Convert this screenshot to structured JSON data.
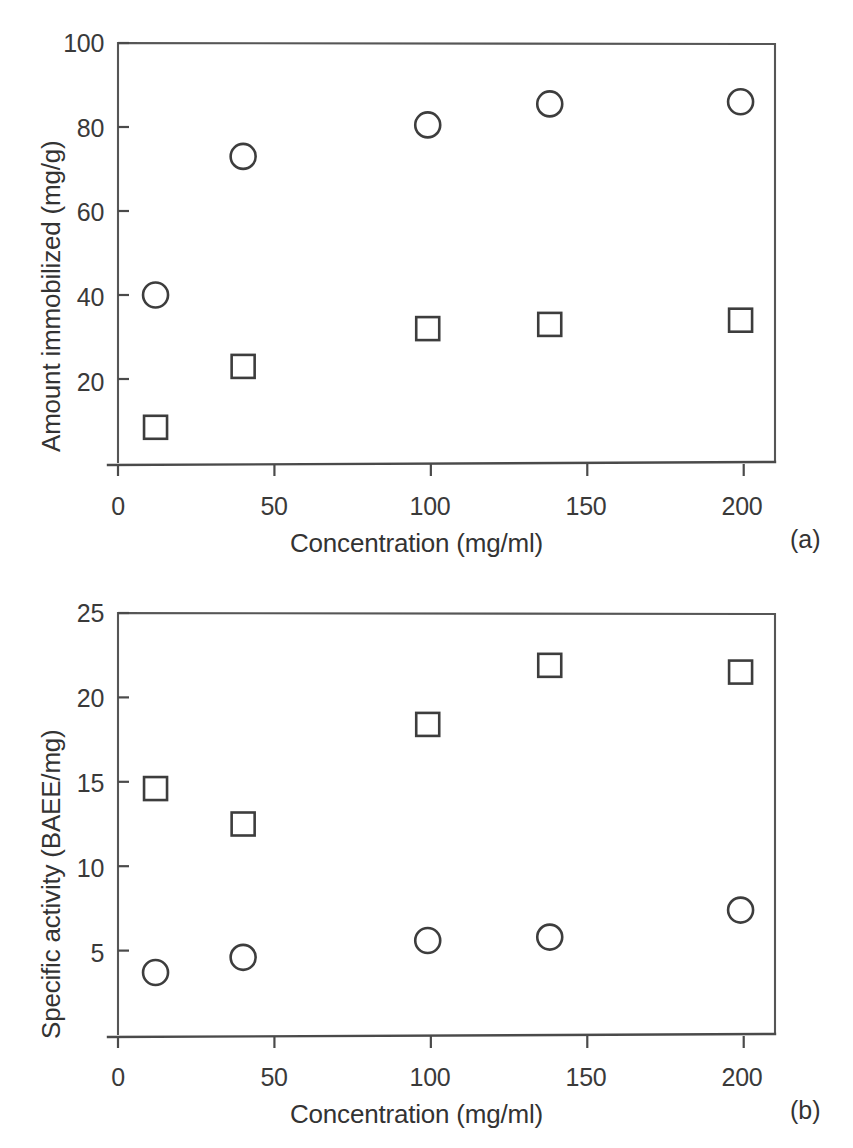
{
  "figure": {
    "background": "#ffffff",
    "ink_color": "#3d3d3d"
  },
  "panels": [
    {
      "id": "a",
      "letter": "(a)",
      "x_title": "Concentration (mg/ml)",
      "y_title": "Amount immobilized (mg/g)",
      "x_ticks": [
        "0",
        "50",
        "100",
        "150",
        "200"
      ],
      "y_ticks": [
        "100",
        "80",
        "60",
        "40",
        "20"
      ]
    },
    {
      "id": "b",
      "letter": "(b)",
      "x_title": "Concentration (mg/ml)",
      "y_title": "Specific activity (BAEE/mg)",
      "x_ticks": [
        "0",
        "50",
        "100",
        "150",
        "200"
      ],
      "y_ticks": [
        "25",
        "20",
        "15",
        "10",
        "5"
      ]
    }
  ],
  "chart_data": [
    {
      "type": "scatter",
      "panel": "a",
      "title": "",
      "xlabel": "Concentration (mg/ml)",
      "ylabel": "Amount immobilized (mg/g)",
      "xlim": [
        0,
        210
      ],
      "ylim": [
        0,
        100
      ],
      "xticks": [
        0,
        50,
        100,
        150,
        200
      ],
      "yticks": [
        0,
        20,
        40,
        60,
        80,
        100
      ],
      "grid": false,
      "legend": "none",
      "series": [
        {
          "name": "open-circle",
          "marker": "circle",
          "x": [
            12,
            40,
            99,
            138,
            199
          ],
          "y": [
            40,
            73,
            80.5,
            85.5,
            86
          ]
        },
        {
          "name": "open-square",
          "marker": "square",
          "x": [
            12,
            40,
            99,
            138,
            199
          ],
          "y": [
            8.5,
            23,
            32,
            33,
            34
          ]
        }
      ]
    },
    {
      "type": "scatter",
      "panel": "b",
      "title": "",
      "xlabel": "Concentration (mg/ml)",
      "ylabel": "Specific activity (BAEE/mg)",
      "xlim": [
        0,
        210
      ],
      "ylim": [
        0,
        25
      ],
      "xticks": [
        0,
        50,
        100,
        150,
        200
      ],
      "yticks": [
        0,
        5,
        10,
        15,
        20,
        25
      ],
      "grid": false,
      "legend": "none",
      "series": [
        {
          "name": "open-square",
          "marker": "square",
          "x": [
            12,
            40,
            99,
            138,
            199
          ],
          "y": [
            14.6,
            12.5,
            18.4,
            21.9,
            21.5
          ]
        },
        {
          "name": "open-circle",
          "marker": "circle",
          "x": [
            12,
            40,
            99,
            138,
            199
          ],
          "y": [
            3.7,
            4.6,
            5.6,
            5.8,
            7.4
          ]
        }
      ]
    }
  ]
}
